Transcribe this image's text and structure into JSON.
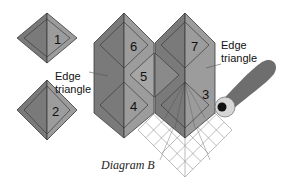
{
  "caption": "Diagram B",
  "labels": {
    "edge_left_line1": "Edge",
    "edge_left_line2": "triangle",
    "edge_right_line1": "Edge",
    "edge_right_line2": "triangle"
  },
  "pieces": [
    {
      "id": "diamond-1",
      "number": "1"
    },
    {
      "id": "diamond-2",
      "number": "2"
    },
    {
      "id": "diamond-3",
      "number": "3"
    },
    {
      "id": "diamond-4",
      "number": "4"
    },
    {
      "id": "diamond-5",
      "number": "5"
    },
    {
      "id": "diamond-6",
      "number": "6"
    },
    {
      "id": "diamond-7",
      "number": "7"
    }
  ],
  "colors": {
    "dark_face": "#7a7a7a",
    "light_face": "#9c9c9c",
    "mid_face": "#8a8a8a",
    "outline": "#3a3a3a",
    "grid": "#8f8f8f",
    "tool": "#6e6e6e",
    "spool_ring": "#d6d6d6"
  }
}
